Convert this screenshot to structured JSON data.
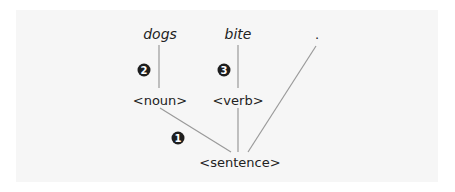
{
  "diagram": {
    "type": "parse-tree",
    "terminals": [
      {
        "id": "dogs",
        "label": "dogs"
      },
      {
        "id": "bite",
        "label": "bite"
      },
      {
        "id": "period",
        "label": "."
      }
    ],
    "nonterminals": [
      {
        "id": "noun",
        "label": "<noun>"
      },
      {
        "id": "verb",
        "label": "<verb>"
      },
      {
        "id": "sentence",
        "label": "<sentence>"
      }
    ],
    "edges": [
      {
        "from": "dogs",
        "to": "noun"
      },
      {
        "from": "bite",
        "to": "verb"
      },
      {
        "from": "noun",
        "to": "sentence"
      },
      {
        "from": "verb",
        "to": "sentence"
      },
      {
        "from": "period",
        "to": "sentence"
      }
    ],
    "markers": [
      {
        "id": "m1",
        "label": "1"
      },
      {
        "id": "m2",
        "label": "2"
      },
      {
        "id": "m3",
        "label": "3"
      }
    ],
    "colors": {
      "line": "#9a9a9a",
      "text": "#222222",
      "marker": "#1e1e1e",
      "panel": "#f6f6f6"
    }
  }
}
